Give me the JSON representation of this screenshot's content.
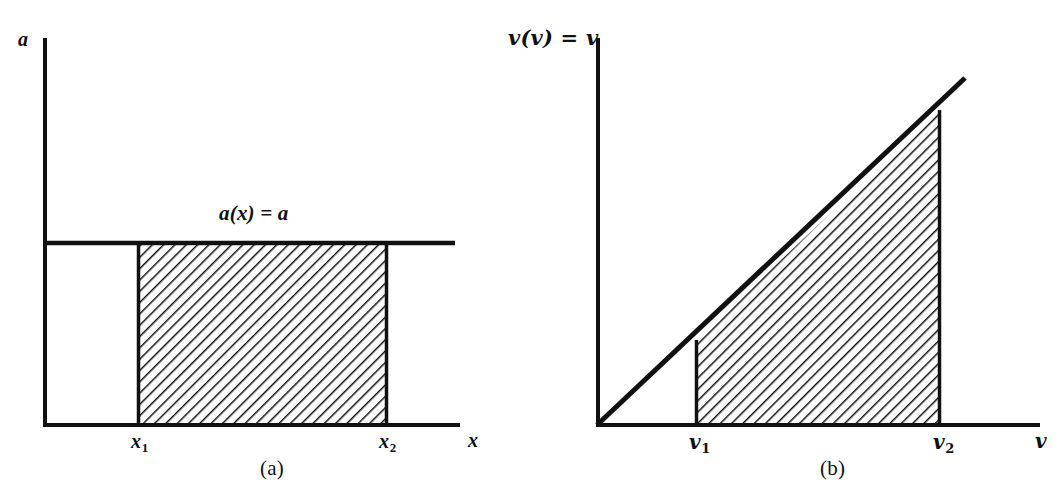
{
  "figure": {
    "background_color": "#ffffff",
    "ink_color": "#111111",
    "panels": [
      {
        "id": "a",
        "caption": "(a)",
        "y_axis_label": "a",
        "x_axis_label": "x",
        "curve_label": "a(x) = a",
        "tick_labels": [
          {
            "base": "x",
            "sub": "1"
          },
          {
            "base": "x",
            "sub": "2"
          }
        ],
        "shaded_region": "rectangle",
        "hatch": {
          "angle_deg": 45,
          "direction": "down-right",
          "spacing_px": 8,
          "line_width_px": 3,
          "color": "#111111"
        },
        "geometry": {
          "y_axis_x": 44,
          "y_axis_top": 38,
          "x_axis_y": 425,
          "x_axis_right": 460,
          "level_line_y": 243,
          "level_line_right": 455,
          "x1": 138,
          "x2": 387
        }
      },
      {
        "id": "b",
        "caption": "(b)",
        "y_axis_label": "v(v) = v",
        "x_axis_label": "v",
        "curve_label": "",
        "tick_labels": [
          {
            "base": "v",
            "sub": "1"
          },
          {
            "base": "v",
            "sub": "2"
          }
        ],
        "shaded_region": "trapezoid",
        "hatch": {
          "angle_deg": 45,
          "direction": "down-right",
          "spacing_px": 8,
          "line_width_px": 3,
          "color": "#111111"
        },
        "geometry": {
          "y_axis_x": 597,
          "y_axis_top": 38,
          "x_axis_y": 425,
          "x_axis_right": 1040,
          "line_end_x": 965,
          "line_end_y": 78,
          "v1": 696,
          "v1_top_y": 340,
          "v2": 940,
          "v2_top_y": 110
        }
      }
    ]
  }
}
